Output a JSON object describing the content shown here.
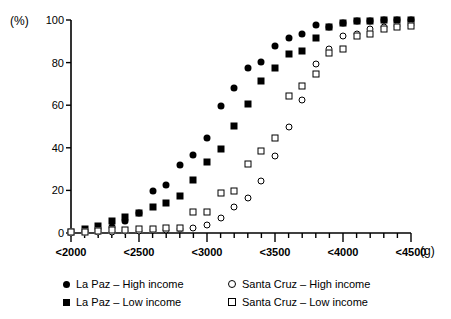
{
  "chart_data": {
    "type": "scatter",
    "title": "",
    "xlabel": "(g)",
    "ylabel": "(%)",
    "ylim": [
      0,
      100
    ],
    "yticks": [
      0,
      20,
      40,
      60,
      80,
      100
    ],
    "ytick_labels": [
      "0",
      "20",
      "40",
      "60",
      "80",
      "100"
    ],
    "xlim": [
      2000,
      4500
    ],
    "xtick_major_labels": [
      "<2000",
      "<2500",
      "<3000",
      "<3500",
      "<4000",
      "<4500"
    ],
    "xtick_major_values": [
      2000,
      2500,
      3000,
      3500,
      4000,
      4500
    ],
    "x_minor_step": 100,
    "grid": false,
    "legend_position": "below",
    "x": [
      2000,
      2100,
      2200,
      2300,
      2400,
      2500,
      2600,
      2700,
      2800,
      2900,
      3000,
      3100,
      3200,
      3300,
      3400,
      3500,
      3600,
      3700,
      3800,
      3900,
      4000,
      4100,
      4200,
      4300,
      4400,
      4500
    ],
    "series": [
      {
        "name": "La Paz – High income",
        "marker": "filled-circle",
        "color": "#000000",
        "values": [
          0.5,
          1.0,
          1.8,
          3.0,
          5.5,
          9.5,
          19.8,
          22.5,
          32.0,
          36.5,
          44.5,
          59.5,
          68.0,
          77.5,
          80.5,
          88.0,
          91.5,
          93.5,
          97.5,
          96.5,
          98.5,
          99.5,
          99.5,
          100,
          100,
          100
        ]
      },
      {
        "name": "La Paz – Low income",
        "marker": "filled-square",
        "color": "#000000",
        "values": [
          0.5,
          2.0,
          3.5,
          5.5,
          7.5,
          9.5,
          12.0,
          14.0,
          17.5,
          25.0,
          33.5,
          39.5,
          50.2,
          60.5,
          71.5,
          77.5,
          84.0,
          85.5,
          91.5,
          96.5,
          98.5,
          99.5,
          99.5,
          100,
          100,
          100
        ]
      },
      {
        "name": "Santa Cruz – High income",
        "marker": "open-circle",
        "color": "#000000",
        "values": [
          0.2,
          0.3,
          0.4,
          0.5,
          0.8,
          1.0,
          1.2,
          1.5,
          1.8,
          2.5,
          3.8,
          7.2,
          12.0,
          16.5,
          24.5,
          36.0,
          49.8,
          62.5,
          79.5,
          86.5,
          92.5,
          93.5,
          96.0,
          96.5,
          97.0,
          97.5
        ]
      },
      {
        "name": "Santa Cruz – Low income",
        "marker": "open-square",
        "color": "#000000",
        "values": [
          0.3,
          0.6,
          1.0,
          1.2,
          1.5,
          1.8,
          2.0,
          2.2,
          2.5,
          9.8,
          9.8,
          18.8,
          19.8,
          32.2,
          38.5,
          44.5,
          64.5,
          69.0,
          74.5,
          84.5,
          86.5,
          92.5,
          93.5,
          96.0,
          96.5,
          97.0
        ]
      }
    ]
  },
  "axes": {
    "y_unit_label": "(%)",
    "x_unit_label": "(g)"
  },
  "legend": {
    "items": [
      {
        "label": "La Paz – High income",
        "marker": "filled-circle"
      },
      {
        "label": "La Paz – Low income",
        "marker": "filled-square"
      },
      {
        "label": "Santa Cruz – High income",
        "marker": "open-circle"
      },
      {
        "label": "Santa Cruz – Low income",
        "marker": "open-square"
      }
    ]
  }
}
